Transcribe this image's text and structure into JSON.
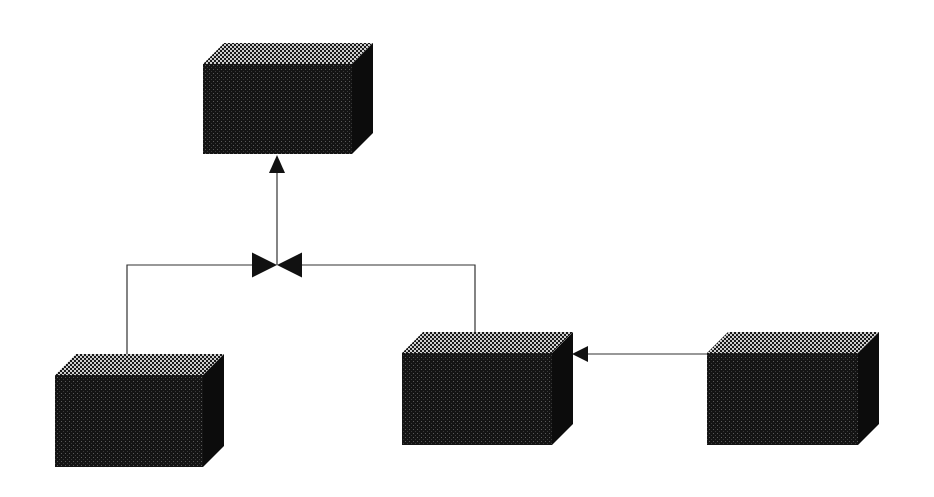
{
  "diagram": {
    "type": "3d-block-network",
    "background": "#ffffff",
    "colors": {
      "front_face": "#141414",
      "front_dot": "#5a5a5a",
      "side_face": "#0c0c0c",
      "top_light": "#cfcfcf",
      "top_dark": "#1a1a1a",
      "line": "#333333",
      "arrow": "#111111"
    },
    "depth": {
      "dx": 21,
      "dy": -21
    },
    "nodes": [
      {
        "id": "top-block",
        "x": 203,
        "y": 64,
        "w": 149,
        "h": 90,
        "label": ""
      },
      {
        "id": "bottom-left-block",
        "x": 55,
        "y": 375,
        "w": 148,
        "h": 92,
        "label": ""
      },
      {
        "id": "middle-block",
        "x": 402,
        "y": 353,
        "w": 150,
        "h": 92,
        "label": ""
      },
      {
        "id": "right-block",
        "x": 707,
        "y": 353,
        "w": 151,
        "h": 92,
        "label": ""
      }
    ],
    "junction": {
      "id": "bowtie-junction",
      "x": 277,
      "y": 265,
      "half_width": 25,
      "half_height": 12.5
    },
    "connectors": [
      {
        "id": "left-branch",
        "points": [
          [
            127,
            375
          ],
          [
            127,
            265
          ],
          [
            252,
            265
          ]
        ]
      },
      {
        "id": "right-branch",
        "points": [
          [
            475,
            353
          ],
          [
            475,
            265
          ],
          [
            302,
            265
          ]
        ]
      },
      {
        "id": "junction-to-top",
        "points": [
          [
            277,
            265
          ],
          [
            277,
            172
          ]
        ],
        "arrow": {
          "tip": [
            277,
            155
          ],
          "direction": "up"
        }
      },
      {
        "id": "right-to-middle",
        "points": [
          [
            707,
            354
          ],
          [
            588,
            354
          ]
        ],
        "arrow": {
          "tip": [
            572,
            354
          ],
          "direction": "left"
        }
      }
    ]
  }
}
